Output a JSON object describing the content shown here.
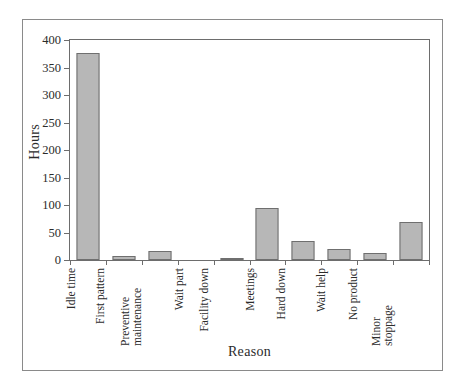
{
  "chart_data": {
    "type": "bar",
    "title": "",
    "xlabel": "Reason",
    "ylabel": "Hours",
    "categories": [
      "Idle time",
      "First pattern",
      "Preventive maintenance",
      "Wait part",
      "Facility down",
      "Meetings",
      "Hard down",
      "Wait help",
      "No product",
      "Minor stoppage"
    ],
    "category_lines": [
      [
        "Idle time"
      ],
      [
        "First pattern"
      ],
      [
        "Preventive",
        "maintenance"
      ],
      [
        "Wait part"
      ],
      [
        "Facility down"
      ],
      [
        "Meetings"
      ],
      [
        "Hard down"
      ],
      [
        "Wait help"
      ],
      [
        "No product"
      ],
      [
        "Minor",
        "stoppage"
      ]
    ],
    "values": [
      376,
      7,
      16,
      0,
      4,
      94,
      34,
      20,
      12,
      70
    ],
    "ylim": [
      0,
      400
    ],
    "yticks": [
      0,
      50,
      100,
      150,
      200,
      250,
      300,
      350,
      400
    ],
    "ytick_labels": [
      "0",
      "50",
      "100",
      "150",
      "200",
      "250",
      "300",
      "350",
      "400"
    ],
    "grid": false,
    "legend": false,
    "bar_fill_color": "#b7b7b7",
    "bar_edge_color": "#6f6f6f",
    "axis_color": "#6d6d6d",
    "frame_color": "#8a8a8a",
    "text_color": "#2b2b2b"
  }
}
